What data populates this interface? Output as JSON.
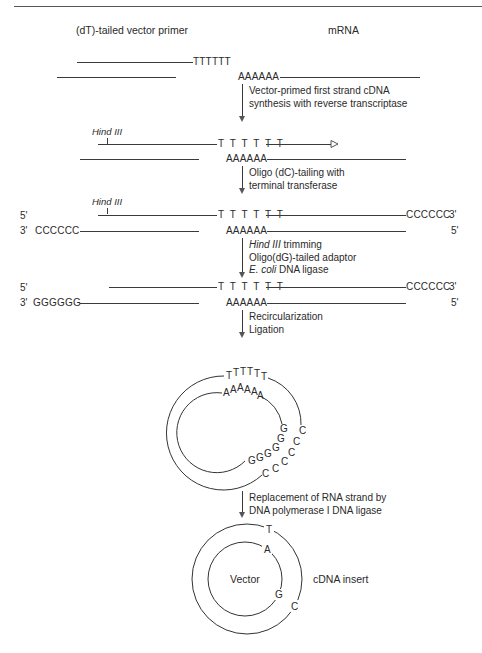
{
  "header": {
    "running_head": "…"
  },
  "labels": {
    "vector_primer": "(dT)-tailed vector primer",
    "mrna": "mRNA"
  },
  "sequences": {
    "t_tail": "TTTTTT",
    "t_tail_spaced": "T T T T T T",
    "a_tail": "AAAAAA",
    "c_tail_5": "CCCCCC",
    "g_tail": "GGGGGG",
    "five_prime": "5'",
    "three_prime": "3'"
  },
  "restriction_site": "Hind III",
  "steps": [
    {
      "name": "first-strand-synthesis",
      "lines": [
        "Vector-primed first strand cDNA",
        "synthesis with reverse transcriptase"
      ]
    },
    {
      "name": "dc-tailing",
      "lines": [
        "Oligo (dC)-tailing with",
        "terminal transferase"
      ]
    },
    {
      "name": "hind-trimming",
      "lines": [
        {
          "italic": "Hind III",
          "rest": " trimming"
        },
        {
          "italic": "",
          "rest": "Oligo(dG)-tailed adaptor"
        },
        {
          "italic": "E. coli",
          "rest": " DNA ligase"
        }
      ]
    },
    {
      "name": "recircularization",
      "lines": [
        "Recircularization",
        "Ligation"
      ]
    },
    {
      "name": "rna-replacement",
      "lines": [
        "Replacement of RNA strand by",
        "DNA polymerase I DNA ligase"
      ]
    }
  ],
  "circle1": {
    "outer_letters": [
      "T",
      "T",
      "T",
      "T",
      "T",
      "T",
      "C",
      "C",
      "C",
      "C",
      "C",
      "C"
    ],
    "inner_letters": [
      "A",
      "A",
      "A",
      "A",
      "A",
      "A",
      "G",
      "G",
      "G",
      "G",
      "G",
      "G"
    ]
  },
  "circle2": {
    "outer_T": "T",
    "outer_C": "C",
    "inner_A": "A",
    "inner_G": "G",
    "vector_label": "Vector",
    "insert_label": "cDNA insert"
  }
}
